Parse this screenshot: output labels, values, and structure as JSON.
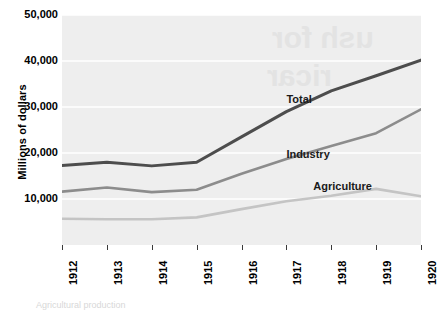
{
  "chart_data": {
    "type": "line",
    "title": "",
    "xlabel": "",
    "ylabel": "Millions of dollars",
    "categories": [
      "1912",
      "1913",
      "1914",
      "1915",
      "1916",
      "1917",
      "1918",
      "1919",
      "1920"
    ],
    "x": [
      1912,
      1913,
      1914,
      1915,
      1916,
      1917,
      1918,
      1919,
      1920
    ],
    "xlim": [
      1912,
      1920
    ],
    "ylim": [
      0,
      50000
    ],
    "yticks": [
      10000,
      20000,
      30000,
      40000,
      50000
    ],
    "ytick_labels": [
      "10,000",
      "20,000",
      "30,000",
      "40,000",
      "50,000"
    ],
    "grid": true,
    "grid_axis": "y",
    "grid_color": "#ffffff",
    "plot_background": "#eeeeee",
    "legend_position": "inline-labels",
    "series": [
      {
        "name": "Total",
        "color": "#4d4d4d",
        "width": 3.0,
        "values": [
          17300,
          18000,
          17200,
          18000,
          23500,
          29000,
          33500,
          36800,
          40200
        ]
      },
      {
        "name": "Industry",
        "color": "#8c8c8c",
        "width": 2.6,
        "values": [
          11600,
          12500,
          11500,
          12000,
          15500,
          18700,
          21500,
          24300,
          29500
        ]
      },
      {
        "name": "Agriculture",
        "color": "#c4c4c4",
        "width": 2.6,
        "values": [
          5700,
          5600,
          5600,
          6000,
          7800,
          9500,
          10700,
          12200,
          10600
        ]
      }
    ],
    "annotations": [
      {
        "text": "Total",
        "x": 1917.0,
        "y": 31500
      },
      {
        "text": "Industry",
        "x": 1917.0,
        "y": 19600
      },
      {
        "text": "Agriculture",
        "x": 1917.6,
        "y": 12700
      }
    ]
  },
  "watermark": {
    "lines": [
      {
        "text": "ush for",
        "x": 210,
        "y": 6,
        "size": 30
      },
      {
        "text": "ricar",
        "x": 205,
        "y": 44,
        "size": 30
      }
    ]
  },
  "bottom_remnant": {
    "text": "Agricultural production"
  }
}
